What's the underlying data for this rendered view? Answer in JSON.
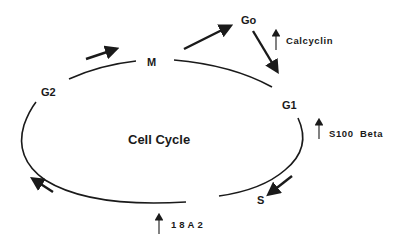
{
  "diagram": {
    "title": "Cell Cycle",
    "phases": {
      "M": "M",
      "G1": "G1",
      "S": "S",
      "G2": "G2",
      "Go": "Go"
    },
    "factors": {
      "calcyclin": "Calcyclin",
      "s100_beta": "S100  Beta",
      "18a2": "18A2"
    },
    "colors": {
      "line": "#1a1a1a",
      "background": "#ffffff"
    }
  }
}
